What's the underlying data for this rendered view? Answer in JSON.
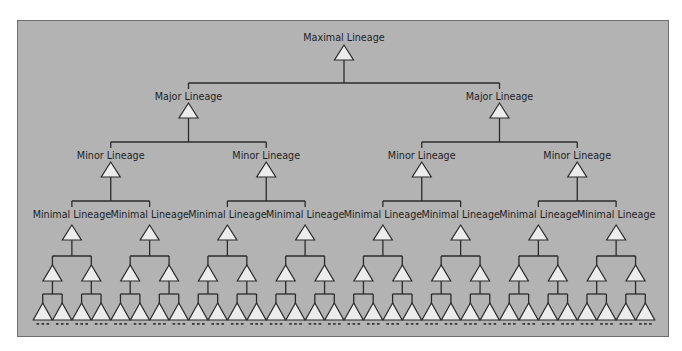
{
  "diagram": {
    "colors": {
      "panel": "#b3b3b3",
      "line": "#2b2b2b",
      "triangle": "#ececec"
    },
    "levels": [
      {
        "name": "maximal",
        "label": "Maximal Lineage",
        "count": 1
      },
      {
        "name": "major",
        "label": "Major Lineage",
        "count": 2
      },
      {
        "name": "minor",
        "label": "Minor Lineage",
        "count": 4
      },
      {
        "name": "minimal",
        "label": "Minimal Lineage",
        "count": 8
      },
      {
        "name": "sub-level-1",
        "label": "",
        "count": 16
      },
      {
        "name": "sub-level-2",
        "label": "",
        "count": 32
      }
    ],
    "leaf_marker": "..."
  }
}
